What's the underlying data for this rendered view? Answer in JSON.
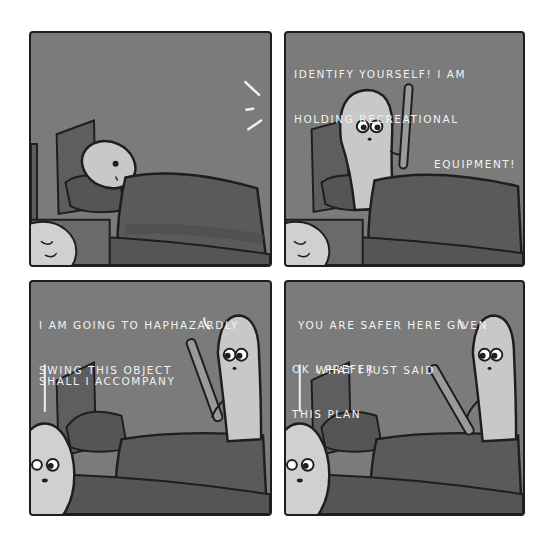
{
  "comic": {
    "panel_count": 4,
    "colors": {
      "background": "#ffffff",
      "panel_fill": "#7b7b7b",
      "border": "#1e1e1e",
      "text": "#f2f2f2",
      "blanket": "#5a5a5a",
      "character": "#c8c8c8"
    },
    "panels": [
      {
        "index": 1,
        "scene": "figure lying in bed, awake, hearing a noise",
        "sound_effect": "noise-lines",
        "captions": []
      },
      {
        "index": 2,
        "scene": "pale figure standing beside bed holding a baseball bat",
        "captions": [
          {
            "line1": "IDENTIFY YOURSELF! I AM",
            "line2": "HOLDING RECREATIONAL",
            "line3": "EQUIPMENT!"
          }
        ]
      },
      {
        "index": 3,
        "scene": "figure with bat leaving; person in bed peeks out",
        "captions": [
          {
            "line1": "I AM GOING TO HAPHAZARDLY",
            "line2": "SWING THIS OBJECT"
          },
          {
            "line1": "SHALL I ACCOMPANY"
          }
        ]
      },
      {
        "index": 4,
        "scene": "figure with bat leaving; person in bed peeks out",
        "captions": [
          {
            "line1": "YOU ARE SAFER HERE GIVEN",
            "line2": "WHAT I JUST SAID"
          },
          {
            "line1": "OK I PREFER",
            "line2": "THIS PLAN"
          }
        ]
      }
    ]
  }
}
